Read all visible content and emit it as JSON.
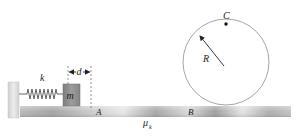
{
  "diagram": {
    "labels": {
      "spring_constant": "k",
      "mass": "m",
      "compression": "d",
      "point_a": "A",
      "point_b": "B",
      "point_c": "C",
      "radius": "R",
      "friction": "μ",
      "friction_sub": "k"
    },
    "colors": {
      "track_dark": "#9a9a9a",
      "track_light": "#e6e6e6",
      "wall": "#d8d8d8",
      "mass_block": "#8c8c8c",
      "loop_stroke": "#9a9a9a",
      "ink": "#222222"
    }
  }
}
